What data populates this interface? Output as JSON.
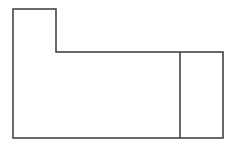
{
  "diagram": {
    "stroke_color": "#3a3a3a",
    "background": "#ffffff",
    "outline_points": "13,9 56,9 56,52 223,52 223,138 13,138",
    "divider": {
      "x1": 180,
      "y1": 52,
      "x2": 180,
      "y2": 138
    }
  }
}
